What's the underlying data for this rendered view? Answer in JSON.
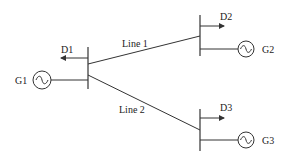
{
  "diagram": {
    "title": "",
    "buses": [
      {
        "id": "bus1",
        "load_label": "D1",
        "gen_label": "G1"
      },
      {
        "id": "bus2",
        "load_label": "D2",
        "gen_label": "G2"
      },
      {
        "id": "bus3",
        "load_label": "D3",
        "gen_label": "G3"
      }
    ],
    "lines": [
      {
        "id": "line1",
        "label": "Line 1",
        "from": "bus1",
        "to": "bus2"
      },
      {
        "id": "line2",
        "label": "Line 2",
        "from": "bus1",
        "to": "bus3"
      }
    ],
    "colors": {
      "stroke": "#333333",
      "text": "#222222",
      "background": "#ffffff"
    }
  }
}
